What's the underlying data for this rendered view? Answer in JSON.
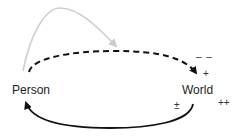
{
  "diagram": {
    "nodes": [
      {
        "id": "person",
        "label": "Person"
      },
      {
        "id": "world",
        "label": "World"
      }
    ],
    "edges": [
      {
        "from": "person",
        "to": "world",
        "style": "dashed",
        "color": "#111111",
        "description": "upper dashed arc"
      },
      {
        "from": "world",
        "to": "person",
        "style": "solid",
        "color": "#111111",
        "description": "lower solid arc"
      },
      {
        "from": "person",
        "to": "dashed-arc",
        "style": "solid",
        "color": "#cccccc",
        "description": "grey arc onto the dashed arrow"
      }
    ],
    "symbols": {
      "minus_minus": "– –",
      "plus": "+",
      "plus_minus": "±",
      "plus_plus": "++"
    }
  }
}
